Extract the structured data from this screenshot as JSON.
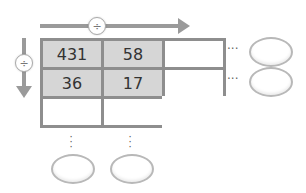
{
  "diagram": {
    "horizontal_operator": "÷",
    "vertical_operator": "÷",
    "grid": [
      [
        "431",
        "58",
        ""
      ],
      [
        "36",
        "17",
        ""
      ],
      [
        "",
        "",
        ""
      ]
    ],
    "row_ellipsis": "···",
    "col_ellipsis": "⋮",
    "colors": {
      "arrow": "#9a9a9a",
      "grid_border": "#8e8e8e",
      "filled_cell": "#d6d6d6",
      "empty_cell": "#ffffff",
      "answer_oval_border": "#b8b8b8"
    }
  }
}
